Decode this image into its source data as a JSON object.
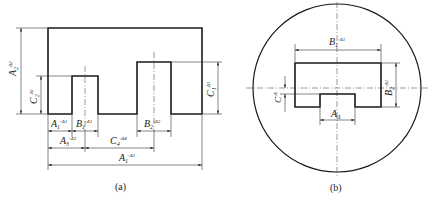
{
  "figure_a": {
    "caption": "(a)",
    "labels": {
      "A2": {
        "base": "A",
        "sub": "2",
        "sup": "Δ2"
      },
      "C2": {
        "base": "C",
        "sub": "2",
        "sup": "Δ1"
      },
      "C1": {
        "base": "C",
        "sub": "1",
        "sup": "Δ3"
      },
      "A1_small": {
        "base": "A",
        "sub": "1",
        "sup": "-Δ1"
      },
      "B1": {
        "base": "B",
        "sub": "1",
        "sup": "-Δ1"
      },
      "B2": {
        "base": "B",
        "sub": "2",
        "sup": "-Δ2"
      },
      "A3": {
        "base": "A",
        "sub": "3",
        "sup": "-Δ3"
      },
      "C4": {
        "base": "C",
        "sub": "4",
        "sup": "-Δ4"
      },
      "A1_total": {
        "base": "A",
        "sub": "1",
        "sup": "-Δ1"
      }
    }
  },
  "figure_b": {
    "caption": "(b)",
    "labels": {
      "B1": {
        "base": "B",
        "sub": "1",
        "sup": "-Δ1"
      },
      "B2": {
        "base": "B",
        "sub": "2",
        "sup": "-Δ1"
      },
      "C": {
        "base": "C",
        "sub": "",
        "sup": "-Δ"
      },
      "A": {
        "base": "A",
        "sub": "Δ",
        "sup": ""
      }
    }
  }
}
